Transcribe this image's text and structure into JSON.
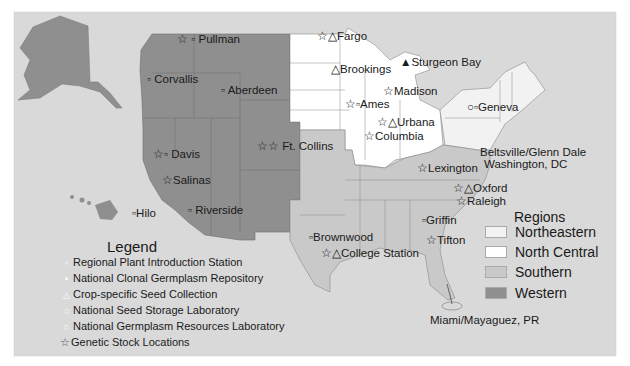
{
  "colors": {
    "background": "#d9d9d9",
    "northeastern": "#f2f2f2",
    "north_central": "#ffffff",
    "southern": "#c9c9c9",
    "western": "#8f8f8f",
    "border": "#777777"
  },
  "cities": [
    {
      "name": "Pullman",
      "symbols": [
        "star",
        "square"
      ]
    },
    {
      "name": "Corvallis",
      "symbols": [
        "dot"
      ]
    },
    {
      "name": "Aberdeen",
      "symbols": [
        "dot"
      ]
    },
    {
      "name": "Davis",
      "symbols": [
        "star",
        "dot"
      ]
    },
    {
      "name": "Salinas",
      "symbols": [
        "star"
      ]
    },
    {
      "name": "Riverside",
      "symbols": [
        "dot"
      ]
    },
    {
      "name": "Hilo",
      "symbols": [
        "dot"
      ]
    },
    {
      "name": "Ft. Collins",
      "symbols": [
        "star",
        "star-white"
      ]
    },
    {
      "name": "Fargo",
      "symbols": [
        "star",
        "triangle"
      ]
    },
    {
      "name": "Brookings",
      "symbols": [
        "triangle"
      ]
    },
    {
      "name": "Sturgeon Bay",
      "symbols": [
        "triangle-filled"
      ]
    },
    {
      "name": "Madison",
      "symbols": [
        "star"
      ]
    },
    {
      "name": "Ames",
      "symbols": [
        "star",
        "square"
      ]
    },
    {
      "name": "Urbana",
      "symbols": [
        "star",
        "triangle"
      ]
    },
    {
      "name": "Columbia",
      "symbols": [
        "star"
      ]
    },
    {
      "name": "Geneva",
      "symbols": [
        "circle",
        "square"
      ]
    },
    {
      "name": "Beltsville/Glenn Dale",
      "symbols": [
        "dot"
      ]
    },
    {
      "name": "Washington, DC",
      "symbols": []
    },
    {
      "name": "Lexington",
      "symbols": [
        "star"
      ]
    },
    {
      "name": "Oxford",
      "symbols": [
        "star",
        "triangle"
      ]
    },
    {
      "name": "Raleigh",
      "symbols": [
        "star"
      ]
    },
    {
      "name": "Griffin",
      "symbols": [
        "dot"
      ]
    },
    {
      "name": "Tifton",
      "symbols": [
        "star"
      ]
    },
    {
      "name": "Brownwood",
      "symbols": [
        "dot"
      ]
    },
    {
      "name": "College Station",
      "symbols": [
        "star",
        "triangle"
      ]
    },
    {
      "name": "Miami/Mayaguez, PR",
      "symbols": [
        "dot"
      ]
    }
  ],
  "legend": {
    "title": "Legend",
    "items": [
      {
        "symbol": "▫",
        "label": "Regional Plant Introduction Station"
      },
      {
        "symbol": "•",
        "label": "National Clonal Germplasm Repository"
      },
      {
        "symbol": "△",
        "label": "Crop-specific Seed Collection"
      },
      {
        "symbol": "☆",
        "label": "National Seed Storage Laboratory"
      },
      {
        "symbol": "○",
        "label": "National Germplasm Resources Laboratory"
      },
      {
        "symbol": "☆",
        "label": "Genetic Stock Locations"
      }
    ]
  },
  "regions": {
    "title": "Regions",
    "items": [
      {
        "label": "Northeastern",
        "color": "#f2f2f2"
      },
      {
        "label": "North Central",
        "color": "#ffffff"
      },
      {
        "label": "Southern",
        "color": "#c9c9c9"
      },
      {
        "label": "Western",
        "color": "#8f8f8f"
      }
    ]
  }
}
